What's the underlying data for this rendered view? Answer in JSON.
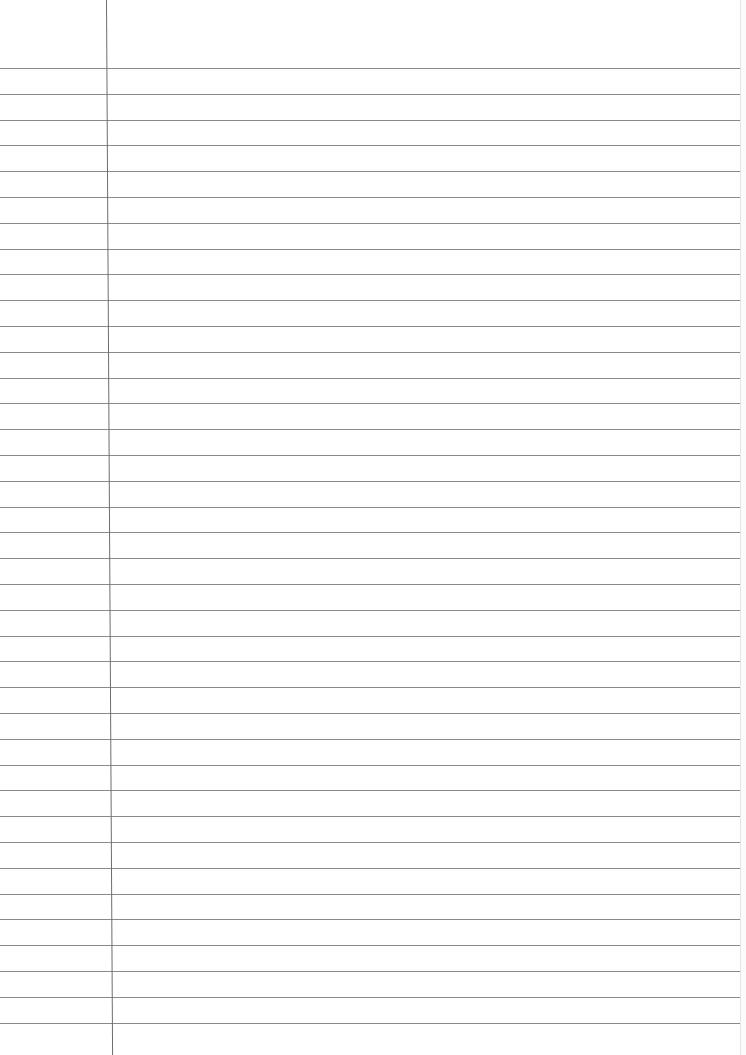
{
  "page": {
    "type": "lined-notebook-paper",
    "rule_count": 38,
    "first_rule_y": 68,
    "rule_spacing": 25.8,
    "margin_x": 106,
    "colors": {
      "paper": "#ffffff",
      "rule": "#8a8a8a",
      "margin": "#6d6d6d"
    }
  }
}
